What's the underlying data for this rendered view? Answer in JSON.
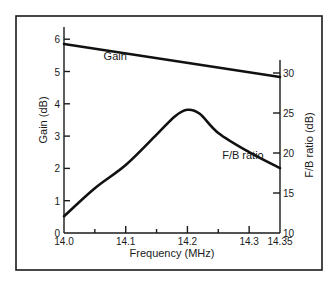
{
  "chart_data": {
    "type": "line",
    "title": "",
    "xlabel": "Frequency (MHz)",
    "ylabel": "Gain (dB)",
    "ylabel_right": "F/B ratio (dB)",
    "xlim": [
      14.0,
      14.35
    ],
    "ylim": [
      0,
      6.4
    ],
    "ylim_right": [
      10,
      32
    ],
    "x_ticks": [
      {
        "value": 14.0,
        "label": "14.0"
      },
      {
        "value": 14.1,
        "label": "14.1"
      },
      {
        "value": 14.2,
        "label": "14.2"
      },
      {
        "value": 14.3,
        "label": "14.3"
      },
      {
        "value": 14.35,
        "label": "14.35"
      }
    ],
    "x_minor_ticks": [
      14.05,
      14.15,
      14.25
    ],
    "y_ticks": [
      {
        "value": 0,
        "label": "0"
      },
      {
        "value": 1,
        "label": "1"
      },
      {
        "value": 2,
        "label": "2"
      },
      {
        "value": 3,
        "label": "3"
      },
      {
        "value": 4,
        "label": "4"
      },
      {
        "value": 5,
        "label": "5"
      },
      {
        "value": 6,
        "label": "6"
      }
    ],
    "y_right_ticks": [
      {
        "value": 10,
        "label": "10"
      },
      {
        "value": 15,
        "label": "15"
      },
      {
        "value": 20,
        "label": "20"
      },
      {
        "value": 25,
        "label": "25"
      },
      {
        "value": 30,
        "label": "30"
      }
    ],
    "grid": false,
    "legend": "none (inline series labels)",
    "series": [
      {
        "name": "Gain",
        "axis": "left",
        "label": "Gain",
        "label_pos": [
          14.083,
          5.35
        ],
        "x": [
          14.0,
          14.35
        ],
        "values": [
          5.85,
          4.83
        ]
      },
      {
        "name": "F/B ratio",
        "axis": "right",
        "label": "F/B ratio",
        "label_pos": [
          14.29,
          19.2
        ],
        "x": [
          14.0,
          14.05,
          14.1,
          14.15,
          14.18,
          14.2,
          14.22,
          14.25,
          14.3,
          14.35
        ],
        "values": [
          12.1,
          15.6,
          18.5,
          22.3,
          24.6,
          25.4,
          24.9,
          22.5,
          20.1,
          18.1
        ]
      }
    ]
  }
}
